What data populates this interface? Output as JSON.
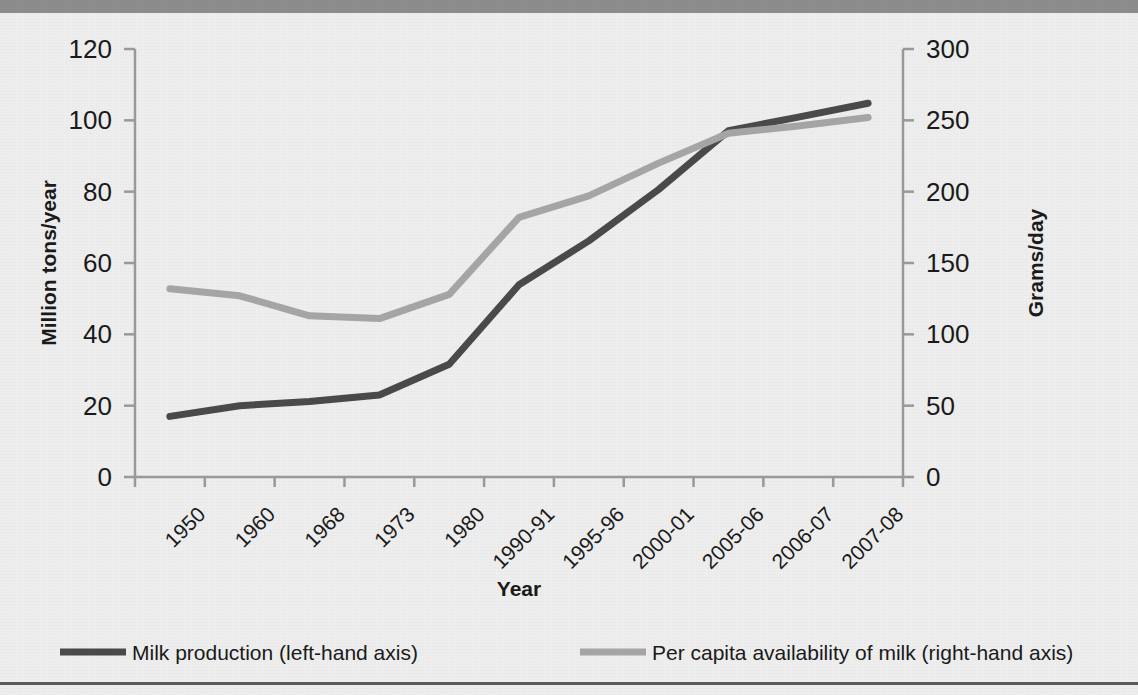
{
  "page": {
    "background_color": "#eeeeee",
    "top_bar_color": "#8d8d8d",
    "bottom_rule_color": "#5a5a5a"
  },
  "chart_data": {
    "type": "line",
    "title": "",
    "xlabel": "Year",
    "categories": [
      "1950",
      "1960",
      "1968",
      "1973",
      "1980",
      "1990-91",
      "1995-96",
      "2000-01",
      "2005-06",
      "2006-07",
      "2007-08"
    ],
    "grid": false,
    "legend_position": "bottom",
    "axes": {
      "left": {
        "label": "Million tons/year",
        "ticks": [
          "0",
          "20",
          "40",
          "60",
          "80",
          "100",
          "120"
        ],
        "min": 0,
        "max": 120,
        "step": 20
      },
      "right": {
        "label": "Grams/day",
        "ticks": [
          "0",
          "50",
          "100",
          "150",
          "200",
          "250",
          "300"
        ],
        "min": 0,
        "max": 300,
        "step": 50
      }
    },
    "series": [
      {
        "name": "Milk production (left-hand axis)",
        "axis": "left",
        "color": "#4a4a4a",
        "values": [
          17,
          20,
          21.2,
          23,
          31.6,
          53.9,
          66.2,
          80.6,
          97.1,
          100.9,
          104.8
        ]
      },
      {
        "name": "Per capita availability of milk (right-hand axis)",
        "axis": "right",
        "color": "#a6a6a6",
        "values": [
          132,
          127,
          113,
          111,
          128,
          182,
          197,
          220,
          241,
          246,
          252
        ]
      }
    ]
  },
  "legend": {
    "items": [
      {
        "label": "Milk production (left-hand axis)",
        "color": "#4a4a4a"
      },
      {
        "label": "Per capita availability of milk (right-hand axis)",
        "color": "#a6a6a6"
      }
    ]
  }
}
